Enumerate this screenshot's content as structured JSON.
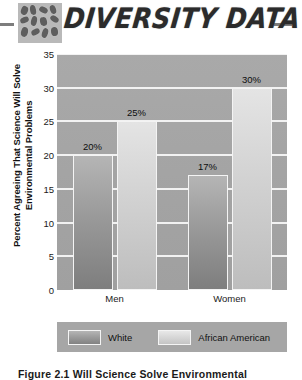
{
  "header": {
    "title": "DIVERSITY DATA",
    "icon": "mosaic-tiles-icon",
    "rule_color": "#7d7d7d"
  },
  "chart_data": {
    "type": "bar",
    "title": "",
    "categories": [
      "Men",
      "Women"
    ],
    "series": [
      {
        "name": "White",
        "values": [
          20,
          17
        ],
        "labels": [
          "20%",
          "17%"
        ],
        "color": "#9a9a9a"
      },
      {
        "name": "African American",
        "values": [
          25,
          30
        ],
        "labels": [
          "25%",
          "30%"
        ],
        "color": "#d2d2d2"
      }
    ],
    "xlabel": "",
    "ylabel": "Percent Agreeing That Science Will Solve Environmental Problems",
    "ylim": [
      0,
      35
    ],
    "yticks": [
      35,
      30,
      25,
      20,
      15,
      10,
      5,
      0
    ],
    "ytick_labels": [
      "35",
      "30",
      "25",
      "20",
      "15",
      "10",
      "5",
      "0"
    ],
    "grid": true,
    "legend_position": "bottom",
    "plot_background": "#a4a4a4"
  },
  "axis": {
    "ylabel_line1": "Percent Agreeing That Science Will Solve",
    "ylabel_line2": "Environmental Problems"
  },
  "legend": {
    "items": [
      {
        "label": "White"
      },
      {
        "label": "African American"
      }
    ]
  },
  "caption": {
    "text": "Figure 2.1  Will Science Solve Environmental"
  }
}
